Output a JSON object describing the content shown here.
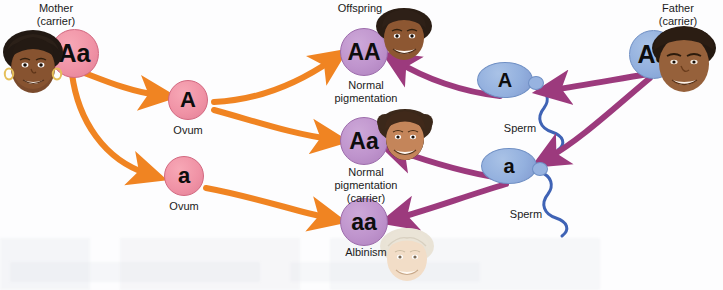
{
  "diagram": {
    "background_color": "#fdfdfe"
  },
  "parents": {
    "mother": {
      "label": "Mother\n(carrier)",
      "genotype": "Aa",
      "circle_color": "#f093a6",
      "skin": "dark"
    },
    "father": {
      "label": "Father\n(carrier)",
      "genotype": "Aa",
      "circle_color": "#93b0de",
      "skin": "dark"
    }
  },
  "gametes": {
    "ova": [
      {
        "allele": "A",
        "label": "Ovum",
        "circle_color": "#f093a6"
      },
      {
        "allele": "a",
        "label": "Ovum",
        "circle_color": "#f093a6"
      }
    ],
    "sperm": [
      {
        "allele": "A",
        "label": "Sperm",
        "head_color": "#93b0de",
        "tail_color": "#3f63b5"
      },
      {
        "allele": "a",
        "label": "Sperm",
        "head_color": "#93b0de",
        "tail_color": "#3f63b5"
      }
    ]
  },
  "offspring": {
    "header": "Offspring",
    "items": [
      {
        "genotype": "AA",
        "phenotype": "Normal\npigmentation",
        "circle_color": "#bf94cd",
        "skin": "pigmented"
      },
      {
        "genotype": "Aa",
        "phenotype": "Normal\npigmentation\n(carrier)",
        "circle_color": "#bf94cd",
        "skin": "pigmented"
      },
      {
        "genotype": "aa",
        "phenotype": "Albinism",
        "circle_color": "#bf94cd",
        "skin": "albino"
      }
    ]
  },
  "arrows": {
    "maternal_color": "#f08422",
    "paternal_color": "#9c3a7d",
    "maternal_count": 5,
    "paternal_count": 5
  }
}
